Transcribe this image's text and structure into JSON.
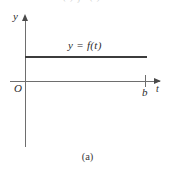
{
  "figure": {
    "cropped_equation_fragment": "( )        ∫0        ( )        =",
    "caption": "(a)",
    "axes": {
      "y_axis_label": "y",
      "t_axis_label": "t",
      "origin_label": "O",
      "b_tick_label": "b"
    },
    "function_label": "y = f(t)",
    "colors": {
      "axis": "#6e6e6e",
      "arrow": "#4a4a4a",
      "function_line": "#3c3c3c",
      "text": "#2b2b2b",
      "background": "#ffffff"
    }
  },
  "chart_data": {
    "type": "line",
    "title": "",
    "subtitle": "",
    "caption": "(a)",
    "xlabel": "t",
    "ylabel": "y",
    "xlim": [
      0,
      1.18
    ],
    "ylim": [
      0,
      1.0
    ],
    "grid": false,
    "legend": false,
    "x_ticks": [
      0,
      1
    ],
    "x_tick_labels": [
      "O",
      "b"
    ],
    "y_ticks": [],
    "y_tick_labels": [],
    "annotations": [
      {
        "text": "y = f(t)",
        "x": 0.37,
        "y": 0.62
      }
    ],
    "series": [
      {
        "name": "y = f(t)",
        "x": [
          0,
          1
        ],
        "values": [
          0.5,
          0.5
        ]
      }
    ]
  }
}
